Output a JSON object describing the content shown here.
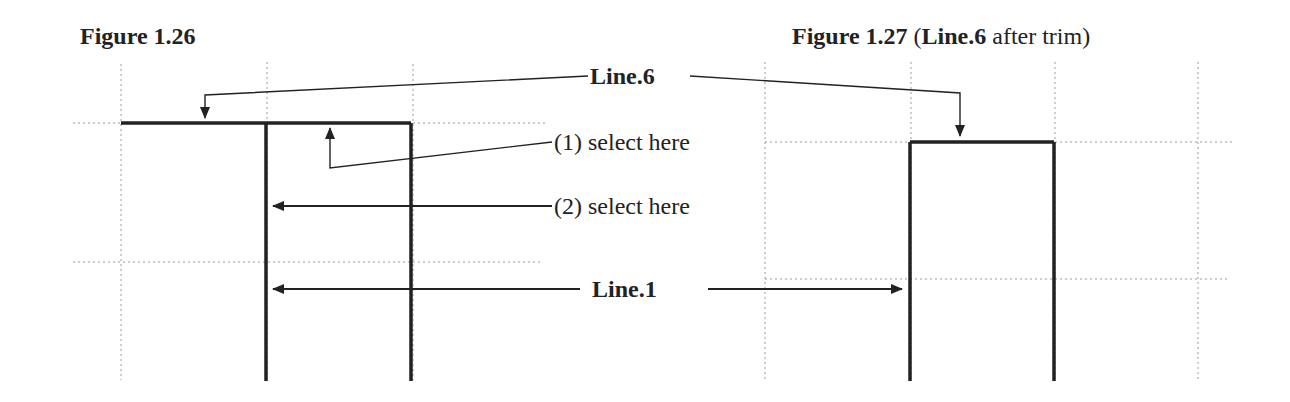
{
  "figure_left": {
    "title": "Figure 1.26",
    "callouts": {
      "line6": "Line.6",
      "select1": "(1) select here",
      "select2": "(2) select here",
      "line1": "Line.1"
    }
  },
  "figure_right": {
    "title_bold": "Figure 1.27",
    "title_paren_open": "(",
    "title_bold_line": "Line.6",
    "title_rest": " after trim)"
  },
  "colors": {
    "line": "#222222",
    "grid": "#9a9a9a",
    "background": "#ffffff"
  }
}
